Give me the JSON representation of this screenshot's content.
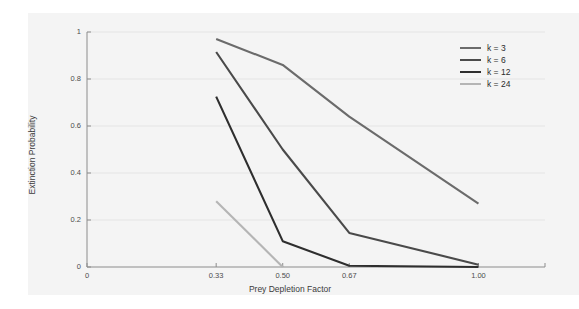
{
  "chart_data": {
    "type": "line",
    "title": "",
    "xlabel": "Prey Depletion Factor",
    "ylabel": "Extinction Probability",
    "xlim": [
      0,
      1.17
    ],
    "ylim": [
      0,
      1
    ],
    "xticks": [
      "0",
      "0.33",
      "0.50",
      "0.67",
      "1.00"
    ],
    "xtickvalues": [
      0,
      0.33,
      0.5,
      0.67,
      1.0
    ],
    "yticks": [
      "0",
      "0.2",
      "0.4",
      "0.6",
      "0.8",
      "1"
    ],
    "ytickvalues": [
      0,
      0.2,
      0.4,
      0.6,
      0.8,
      1.0
    ],
    "grid": true,
    "legend_position": "top-right",
    "x": [
      0.33,
      0.5,
      0.67,
      1.0
    ],
    "series": [
      {
        "name": "k = 3",
        "color": "#6b6b6b",
        "values": [
          0.97,
          0.86,
          0.64,
          0.27
        ]
      },
      {
        "name": "k = 6",
        "color": "#4a4a4a",
        "values": [
          0.915,
          0.5,
          0.145,
          0.01
        ]
      },
      {
        "name": "k = 12",
        "color": "#2e2e2e",
        "values": [
          0.725,
          0.11,
          0.005,
          0.0
        ]
      },
      {
        "name": "k = 24",
        "color": "#b5b5b5",
        "values": [
          0.28,
          0.0,
          null,
          null
        ]
      }
    ]
  },
  "axis": {
    "yticks": [
      {
        "label": "1",
        "value": 1.0
      },
      {
        "label": "0.8",
        "value": 0.8
      },
      {
        "label": "0.6",
        "value": 0.6
      },
      {
        "label": "0.4",
        "value": 0.4
      },
      {
        "label": "0.2",
        "value": 0.2
      },
      {
        "label": "0",
        "value": 0.0
      }
    ],
    "xticks": [
      {
        "label": "0",
        "value": 0.0
      },
      {
        "label": "0.33",
        "value": 0.33
      },
      {
        "label": "0.50",
        "value": 0.5
      },
      {
        "label": "0.67",
        "value": 0.67
      },
      {
        "label": "1.00",
        "value": 1.0
      }
    ],
    "ylabel": "Extinction Probability",
    "xlabel": "Prey Depletion Factor"
  },
  "legend": {
    "entries": [
      {
        "label": "k = 3",
        "color": "#6b6b6b"
      },
      {
        "label": "k = 6",
        "color": "#4a4a4a"
      },
      {
        "label": "k = 12",
        "color": "#2e2e2e"
      },
      {
        "label": "k = 24",
        "color": "#b5b5b5"
      }
    ]
  },
  "style": {
    "background": "#ffffff",
    "panel_background": "#f4f4f4",
    "grid_color": "#e2e2e2",
    "axis_color": "#8c8c8c",
    "text_color": "#4c4c4c"
  }
}
